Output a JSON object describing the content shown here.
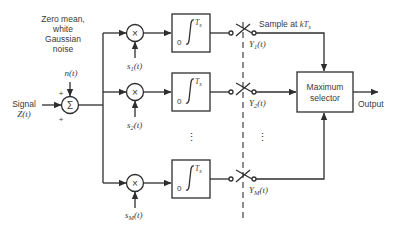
{
  "diagram": {
    "noise_label": [
      "Zero mean,",
      "white",
      "Gaussian",
      "noise"
    ],
    "noise_signal": "n(t)",
    "input": {
      "label_line1": "Signal",
      "label_line2": "Z(t)"
    },
    "summer": {
      "symbol": "Σ",
      "plus_top": "+",
      "plus_bottom": "+"
    },
    "multiplier_symbol": "×",
    "branches": [
      {
        "ref_signal": "s",
        "ref_sub": "1",
        "ref_arg": "(t)",
        "integrator_lower": "0",
        "integrator_upper": "T",
        "integrator_upper_sub": "s",
        "sample_out": "Y",
        "sample_sub": "1",
        "sample_arg": "(t)"
      },
      {
        "ref_signal": "s",
        "ref_sub": "2",
        "ref_arg": "(t)",
        "integrator_lower": "0",
        "integrator_upper": "T",
        "integrator_upper_sub": "s",
        "sample_out": "Y",
        "sample_sub": "2",
        "sample_arg": "(t)"
      },
      {
        "ref_signal": "s",
        "ref_sub": "M",
        "ref_arg": "(t)",
        "integrator_lower": "0",
        "integrator_upper": "T",
        "integrator_upper_sub": "s",
        "sample_out": "Y",
        "sample_sub": "M",
        "sample_arg": "(t)"
      }
    ],
    "ellipsis": "⋮",
    "sample_label": "Sample at ",
    "sample_k": "kT",
    "sample_k_sub": "s",
    "selector": {
      "line1": "Maximum",
      "line2": "selector"
    },
    "output_label": "Output",
    "colors": {
      "line": "#2e2e2e",
      "background": "#ffffff"
    }
  }
}
